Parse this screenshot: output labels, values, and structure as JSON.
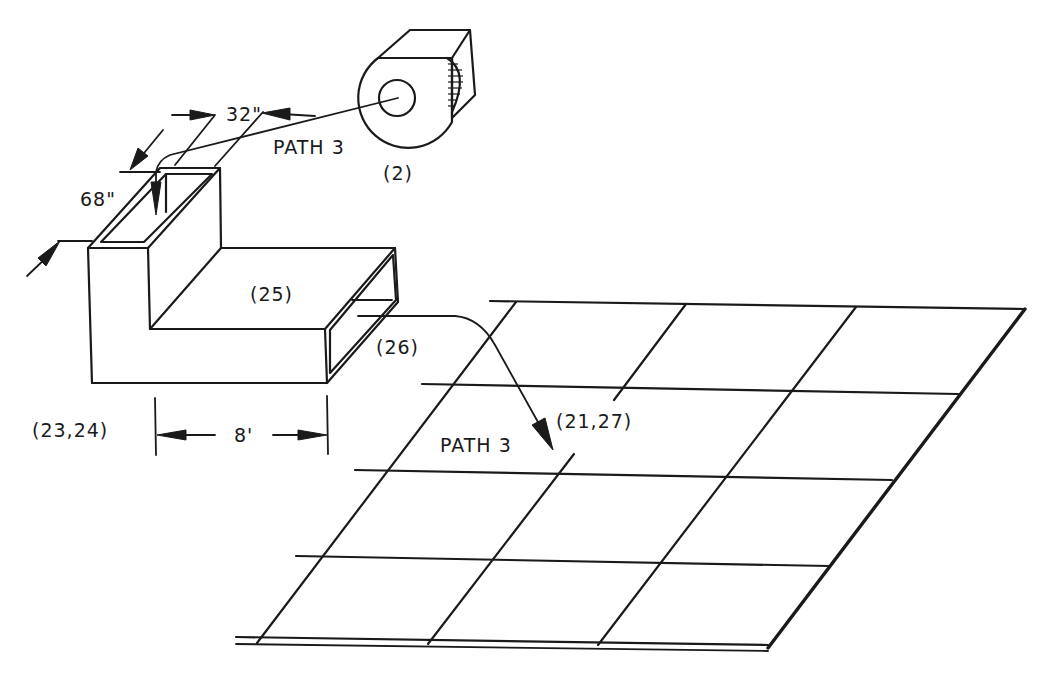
{
  "diagram": {
    "labels": {
      "blower": "(2)",
      "path_upper": "PATH 3",
      "path_lower": "PATH 3",
      "duct_horizontal": "(25)",
      "duct_outlet": "(26)",
      "duct_assembly": "(23,24)",
      "ceiling_target": "(21,27)"
    },
    "dimensions": {
      "riser_width": "32\"",
      "riser_height": "68\"",
      "duct_length": "8'"
    },
    "ceiling_grid": {
      "rows": 4,
      "cols": 3
    },
    "colors": {
      "line": "#1a1a1a",
      "background": "#ffffff"
    }
  }
}
